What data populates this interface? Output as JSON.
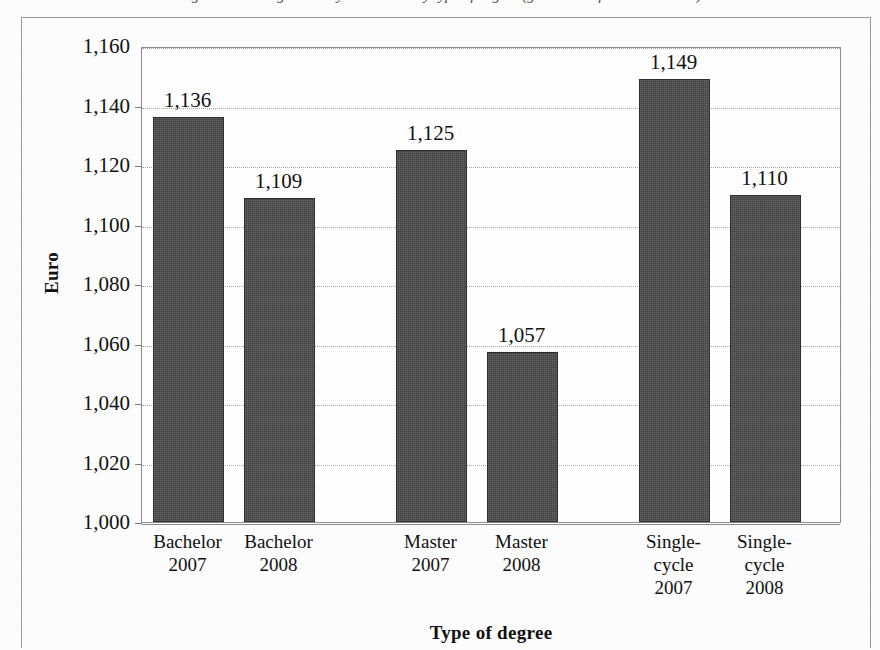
{
  "caption": {
    "text": "Figure 3 - Average monthly net income by type of degree (graduates of 2007 and 2008)"
  },
  "chart_data": {
    "type": "bar",
    "title": "",
    "xlabel": "Type of degree",
    "ylabel": "Euro",
    "categories": [
      "Bachelor 2007",
      "Bachelor 2008",
      "Master 2007",
      "Master 2008",
      "Single-cycle 2007",
      "Single-cycle 2008"
    ],
    "category_lines": [
      [
        "Bachelor",
        "2007"
      ],
      [
        "Bachelor",
        "2008"
      ],
      [
        "Master",
        "2007"
      ],
      [
        "Master",
        "2008"
      ],
      [
        "Single-",
        "cycle",
        "2007"
      ],
      [
        "Single-",
        "cycle",
        "2008"
      ]
    ],
    "values": [
      1136,
      1109,
      1125,
      1057,
      1149,
      1110
    ],
    "value_labels": [
      "1,136",
      "1,109",
      "1,125",
      "1,057",
      "1,149",
      "1,110"
    ],
    "ylim": [
      1000,
      1160
    ],
    "ytick_step": 20,
    "ytick_labels": [
      "1,160",
      "1,140",
      "1,120",
      "1,100",
      "1,080",
      "1,060",
      "1,040",
      "1,020",
      "1,000"
    ],
    "ytick_values": [
      1160,
      1140,
      1120,
      1100,
      1080,
      1060,
      1040,
      1020,
      1000
    ],
    "grid": true,
    "legend": false,
    "bar_color": "#3f3f3f",
    "grid_color": "#a8a8a8",
    "axis_color": "#8d8d8d"
  }
}
